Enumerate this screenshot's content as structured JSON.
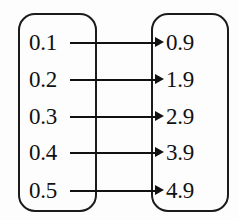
{
  "figure": {
    "kind": "mapping-diagram",
    "clipped_header_sliver": "",
    "colors": {
      "ink": "#111111",
      "box_stroke": "#1b1b1b",
      "background": "#fdfdfd"
    }
  },
  "domain_set": {
    "name": "domain-set",
    "items": [
      {
        "label": "0.1"
      },
      {
        "label": "0.2"
      },
      {
        "label": "0.3"
      },
      {
        "label": "0.4"
      },
      {
        "label": "0.5"
      }
    ]
  },
  "codomain_set": {
    "name": "codomain-set",
    "items": [
      {
        "label": "0.9"
      },
      {
        "label": "1.9"
      },
      {
        "label": "2.9"
      },
      {
        "label": "3.9"
      },
      {
        "label": "4.9"
      }
    ]
  },
  "mappings": [
    {
      "from": "0.1",
      "to": "0.9"
    },
    {
      "from": "0.2",
      "to": "1.9"
    },
    {
      "from": "0.3",
      "to": "2.9"
    },
    {
      "from": "0.4",
      "to": "3.9"
    },
    {
      "from": "0.5",
      "to": "4.9"
    }
  ]
}
